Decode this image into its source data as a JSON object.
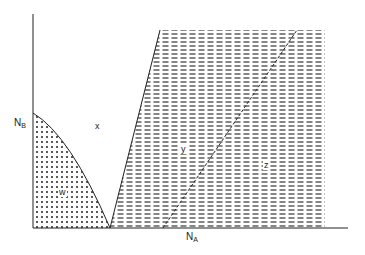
{
  "diagram": {
    "type": "phase-diagram",
    "axes": {
      "x_label": {
        "main": "N",
        "sub": "A"
      },
      "y_label": {
        "main": "N",
        "sub": "B"
      }
    },
    "regions": [
      {
        "id": "w",
        "label": "w",
        "pattern": "dots"
      },
      {
        "id": "x",
        "label": "x",
        "pattern": "blank"
      },
      {
        "id": "y",
        "label": "y",
        "pattern": "dashes"
      },
      {
        "id": "z",
        "label": "z",
        "pattern": "dashes"
      }
    ],
    "colors": {
      "ink": "#222222",
      "background": "#ffffff"
    }
  }
}
